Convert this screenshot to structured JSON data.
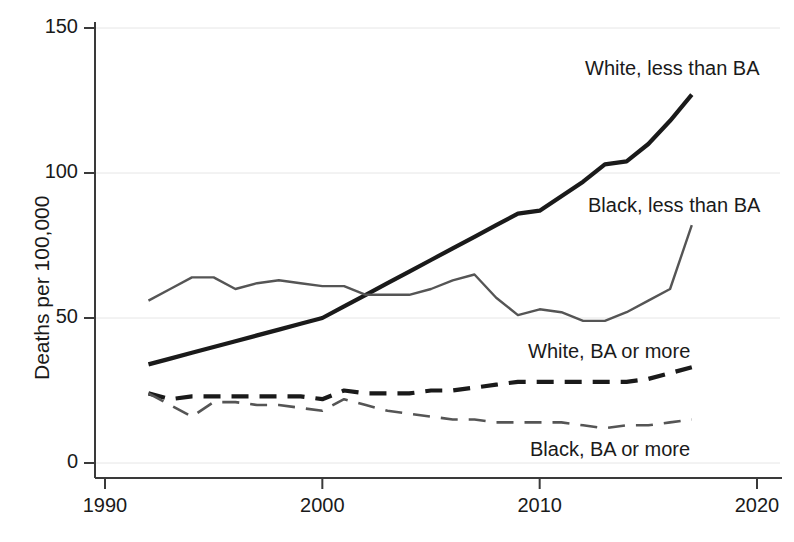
{
  "chart_data": {
    "type": "line",
    "title": "",
    "xlabel": "",
    "ylabel": "Deaths per 100,000",
    "xlim": [
      1990,
      2020
    ],
    "ylim": [
      0,
      150
    ],
    "xticks": [
      "1990",
      "2000",
      "2010",
      "2020"
    ],
    "yticks": [
      "0",
      "50",
      "100",
      "150"
    ],
    "grid": "faint horizontal gridlines at 50, 100, 150",
    "legend_position": "inline labels next to each series",
    "x": [
      1992,
      1993,
      1994,
      1995,
      1996,
      1997,
      1998,
      1999,
      2000,
      2001,
      2002,
      2003,
      2004,
      2005,
      2006,
      2007,
      2008,
      2009,
      2010,
      2011,
      2012,
      2013,
      2014,
      2015,
      2016,
      2017
    ],
    "series": [
      {
        "name": "White, less than BA",
        "style": "solid-thick-black",
        "color": "#1a1a1a",
        "values": [
          34,
          36,
          38,
          40,
          42,
          44,
          46,
          48,
          50,
          54,
          58,
          62,
          66,
          70,
          74,
          78,
          82,
          86,
          87,
          92,
          97,
          103,
          104,
          110,
          118,
          127
        ]
      },
      {
        "name": "Black, less than BA",
        "style": "solid-thin-gray",
        "color": "#555555",
        "values": [
          56,
          60,
          64,
          64,
          60,
          62,
          63,
          62,
          61,
          61,
          58,
          58,
          58,
          60,
          63,
          65,
          57,
          51,
          53,
          52,
          49,
          49,
          52,
          56,
          60,
          82
        ]
      },
      {
        "name": "White, BA or more",
        "style": "dashed-thick-black",
        "color": "#1a1a1a",
        "values": [
          24,
          22,
          23,
          23,
          23,
          23,
          23,
          23,
          22,
          25,
          24,
          24,
          24,
          25,
          25,
          26,
          27,
          28,
          28,
          28,
          28,
          28,
          28,
          29,
          31,
          33
        ]
      },
      {
        "name": "Black, BA or more",
        "style": "dashed-thin-gray",
        "color": "#555555",
        "values": [
          24,
          20,
          16,
          21,
          21,
          20,
          20,
          19,
          18,
          22,
          20,
          18,
          17,
          16,
          15,
          15,
          14,
          14,
          14,
          14,
          13,
          12,
          13,
          13,
          14,
          15
        ]
      }
    ]
  },
  "axis": {
    "ylabel": "Deaths per 100,000",
    "yticks": [
      {
        "label": "150",
        "value": 150
      },
      {
        "label": "100",
        "value": 100
      },
      {
        "label": "50",
        "value": 50
      },
      {
        "label": "0",
        "value": 0
      }
    ],
    "xticks": [
      {
        "label": "1990",
        "value": 1990
      },
      {
        "label": "2000",
        "value": 2000
      },
      {
        "label": "2010",
        "value": 2010
      },
      {
        "label": "2020",
        "value": 2020
      }
    ]
  },
  "series_labels": [
    {
      "text": "White, less than BA",
      "x": 585,
      "y": 57
    },
    {
      "text": "Black, less than BA",
      "x": 588,
      "y": 194
    },
    {
      "text": "White, BA or more",
      "x": 528,
      "y": 340
    },
    {
      "text": "Black, BA or more",
      "x": 530,
      "y": 438
    }
  ],
  "colors": {
    "background": "#ffffff",
    "ink": "#1a1a1a",
    "gray_series": "#555555",
    "gridline": "#e6e6e6",
    "axis": "#3a3a3a"
  }
}
